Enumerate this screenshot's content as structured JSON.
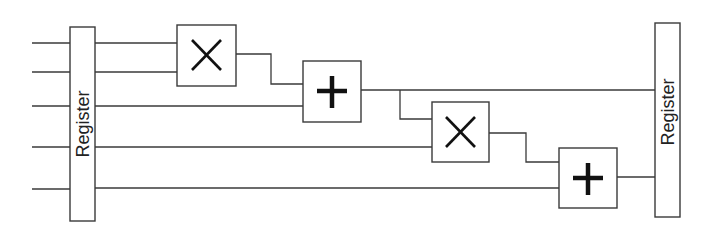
{
  "diagram": {
    "type": "datapath-pipeline",
    "registers": [
      {
        "id": "register-left",
        "label": "Register"
      },
      {
        "id": "register-right",
        "label": "Register"
      }
    ],
    "operators": [
      {
        "id": "multiplier-1",
        "op": "multiply",
        "symbol": "×"
      },
      {
        "id": "adder-1",
        "op": "add",
        "symbol": "+"
      },
      {
        "id": "multiplier-2",
        "op": "multiply",
        "symbol": "×"
      },
      {
        "id": "adder-2",
        "op": "add",
        "symbol": "+"
      }
    ],
    "input_count": 5,
    "colors": {
      "wire": "#3a3a3a",
      "symbol": "#111111",
      "background": "#ffffff"
    }
  }
}
